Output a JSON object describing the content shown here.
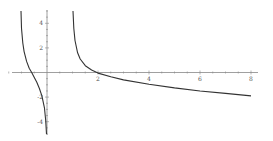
{
  "chart_data": {
    "type": "line",
    "title": "",
    "xlabel": "",
    "ylabel": "",
    "xlim": [
      -1.8,
      8.3
    ],
    "ylim": [
      -5,
      5
    ],
    "grid": false,
    "legend": null,
    "x_ticks": [
      2,
      4,
      6,
      8
    ],
    "x_tick_labels": [
      "2",
      "4",
      "6",
      "8"
    ],
    "y_ticks": [
      -4,
      -2,
      2,
      4
    ],
    "y_tick_labels": [
      "-4",
      "-2",
      "2",
      "4"
    ],
    "series": [
      {
        "name": "left-branch",
        "color": "#333333",
        "x": [
          -1.02,
          -1.0,
          -0.95,
          -0.9,
          -0.8,
          -0.7,
          -0.6,
          -0.5,
          -0.4,
          -0.3,
          -0.2,
          -0.1,
          -0.05,
          -0.02
        ],
        "y": [
          5,
          3.6,
          2.4,
          1.7,
          0.9,
          0.35,
          0.0,
          -0.4,
          -0.8,
          -1.3,
          -1.9,
          -2.9,
          -3.9,
          -5
        ]
      },
      {
        "name": "right-branch",
        "color": "#333333",
        "x": [
          1.02,
          1.05,
          1.1,
          1.2,
          1.3,
          1.5,
          1.75,
          2.0,
          2.5,
          3.0,
          4.0,
          5.0,
          6.0,
          7.0,
          8.0
        ],
        "y": [
          5,
          3.6,
          2.6,
          1.6,
          1.1,
          0.55,
          0.2,
          -0.05,
          -0.35,
          -0.6,
          -0.95,
          -1.25,
          -1.5,
          -1.7,
          -1.9
        ]
      }
    ]
  }
}
